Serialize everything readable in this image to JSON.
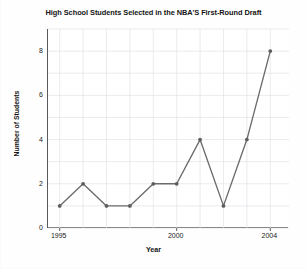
{
  "chart_data": {
    "type": "line",
    "title": "High School Students Selected in the NBA'S First-Round Draft",
    "xlabel": "Year",
    "ylabel": "Number of Students",
    "x": [
      1995,
      1996,
      1997,
      1998,
      1999,
      2000,
      2001,
      2002,
      2003,
      2004
    ],
    "values": [
      1,
      2,
      1,
      1,
      2,
      2,
      4,
      1,
      4,
      8
    ],
    "series": [
      {
        "name": "Number of Students",
        "values": [
          1,
          2,
          1,
          1,
          2,
          2,
          4,
          1,
          4,
          8
        ]
      }
    ],
    "xlim": [
      1994.5,
      2004.8
    ],
    "ylim": [
      0,
      9
    ],
    "x_tick_labels": [
      "1995",
      "2000",
      "2004"
    ],
    "x_tick_values": [
      1995,
      2000,
      2004
    ],
    "y_tick_labels": [
      "0",
      "2",
      "4",
      "6",
      "8"
    ],
    "y_tick_values": [
      0,
      2,
      4,
      6,
      8
    ],
    "grid": true,
    "grid_x_step": 1,
    "grid_y_step": 1,
    "legend": "none",
    "marker": "circle",
    "line_color": "#6b6b6b",
    "marker_color": "#5e5e5e",
    "grid_color": "#e2e2e6",
    "axis_color": "#5a5a5a",
    "background_color": "#ffffff"
  }
}
